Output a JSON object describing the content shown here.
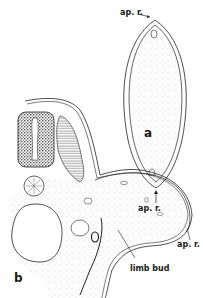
{
  "figure": {
    "panels": [
      {
        "id": "a",
        "label": "a",
        "description": "transverse section of limb bud (oval)",
        "annotations": [
          "ap. r.",
          "ap. r."
        ]
      },
      {
        "id": "b",
        "label": "b",
        "description": "transverse section of embryo showing neural tube, notochord and limb bud",
        "annotations": [
          "ap. r.",
          "limb bud"
        ]
      }
    ],
    "labels": {
      "a_top": "ap. r.",
      "a_bottom": "ap. r.",
      "a_panel": "a",
      "b_panel": "b",
      "b_apr": "ap. r.",
      "b_limb_bud": "limb bud"
    },
    "colors": {
      "ink": "#1a1a1a",
      "background": "#ffffff"
    }
  }
}
